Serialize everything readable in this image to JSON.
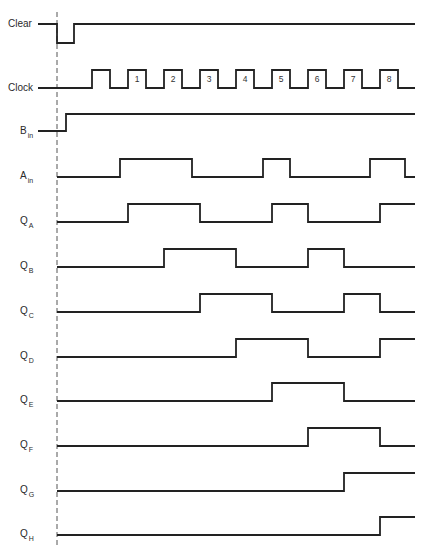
{
  "colors": {
    "line": "#222222",
    "text": "#2a2a2a",
    "dash": "#555555",
    "background": "#ffffff"
  },
  "clock": {
    "pulse_numbers": [
      "1",
      "2",
      "3",
      "4",
      "5",
      "6",
      "7",
      "8"
    ],
    "rising_edges_x": [
      92,
      128,
      164,
      200,
      236,
      272,
      308,
      344,
      380
    ],
    "falling_edges_x": [
      110,
      146,
      182,
      218,
      254,
      290,
      326,
      362,
      398
    ]
  },
  "reference_line_x": 57,
  "signals": [
    {
      "name": "Clear",
      "label": "Clear",
      "sub": "",
      "y_high": 24,
      "y_low": 43,
      "start": "high",
      "transitions": [
        57,
        74
      ],
      "label_type": "arrow"
    },
    {
      "name": "Clock",
      "label": "Clock",
      "sub": "",
      "y_high": 70,
      "y_low": 88,
      "start": "low",
      "transitions": [
        92,
        110,
        128,
        146,
        164,
        182,
        200,
        218,
        236,
        254,
        272,
        290,
        308,
        326,
        344,
        362,
        380,
        398
      ],
      "label_type": "arrow"
    },
    {
      "name": "B_in",
      "label": "B",
      "sub": "in",
      "y_high": 114,
      "y_low": 131,
      "start": "low",
      "transitions": [
        66
      ],
      "label_type": "arrow"
    },
    {
      "name": "A_in",
      "label": "A",
      "sub": "in",
      "y_high": 159,
      "y_low": 177,
      "start": "low",
      "transitions": [
        120,
        192,
        263,
        290,
        370,
        405
      ]
    },
    {
      "name": "Q_A",
      "label": "Q",
      "sub": "A",
      "y_high": 204,
      "y_low": 222,
      "start": "low",
      "transitions": [
        128,
        200,
        272,
        308,
        380
      ]
    },
    {
      "name": "Q_B",
      "label": "Q",
      "sub": "B",
      "y_high": 249,
      "y_low": 267,
      "start": "low",
      "transitions": [
        164,
        236,
        308,
        344
      ]
    },
    {
      "name": "Q_C",
      "label": "Q",
      "sub": "C",
      "y_high": 294,
      "y_low": 312,
      "start": "low",
      "transitions": [
        200,
        272,
        344,
        380
      ]
    },
    {
      "name": "Q_D",
      "label": "Q",
      "sub": "D",
      "y_high": 339,
      "y_low": 357,
      "start": "low",
      "transitions": [
        236,
        308,
        380
      ]
    },
    {
      "name": "Q_E",
      "label": "Q",
      "sub": "E",
      "y_high": 383,
      "y_low": 401,
      "start": "low",
      "transitions": [
        272,
        344
      ]
    },
    {
      "name": "Q_F",
      "label": "Q",
      "sub": "F",
      "y_high": 428,
      "y_low": 446,
      "start": "low",
      "transitions": [
        308,
        380
      ]
    },
    {
      "name": "Q_G",
      "label": "Q",
      "sub": "G",
      "y_high": 473,
      "y_low": 491,
      "start": "low",
      "transitions": [
        344
      ]
    },
    {
      "name": "Q_H",
      "label": "Q",
      "sub": "H",
      "y_high": 517,
      "y_low": 535,
      "start": "low",
      "transitions": [
        380
      ]
    }
  ],
  "x_end": 415
}
